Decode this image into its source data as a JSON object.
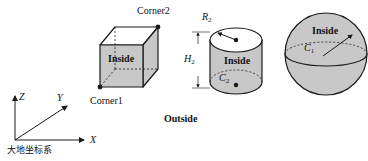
{
  "figure": {
    "colors": {
      "fill": "#c8c8c8",
      "fill_top": "#ffffff",
      "stroke": "#1a1a1a",
      "background": "#ffffff"
    },
    "cube": {
      "inside_label": "Inside",
      "corner1_label": "Corner1",
      "corner2_label": "Corner2"
    },
    "cylinder": {
      "inside_label": "Inside",
      "radius_label": "R",
      "radius_sub": "2",
      "height_label": "H",
      "height_sub": "2",
      "center_label": "C",
      "center_sub": "2"
    },
    "sphere": {
      "inside_label": "Inside",
      "center_label": "C",
      "center_sub": "1"
    },
    "outside_label": "Outside",
    "axes": {
      "x_label": "X",
      "y_label": "Y",
      "z_label": "Z",
      "caption": "大地坐标系"
    }
  }
}
